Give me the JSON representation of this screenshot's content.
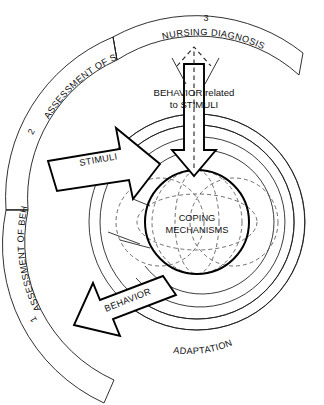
{
  "diagram": {
    "bands": [
      {
        "id": "nursing-diagnosis",
        "label": "NURSING DIAGNOSIS",
        "number": "3"
      },
      {
        "id": "assessment-of-stimuli",
        "label": "ASSESSMENT OF STIMULI",
        "number": "2"
      },
      {
        "id": "assessment-of-behavior",
        "label": "ASSESSMENT OF BEHAVIOR",
        "number": "1"
      }
    ],
    "center": {
      "line1": "COPING",
      "line2": "MECHANISMS"
    },
    "arrows": {
      "stimuli": "STIMULI",
      "behavior": "BEHAVIOR",
      "inward_callout_line1": "BEHAVIOR related",
      "inward_callout_line2": "to STIMULI"
    },
    "rings": {
      "adaptation": "ADAPTATION"
    },
    "colors": {
      "background": "#ffffff",
      "stroke": "#1a1a1a",
      "bold_stroke": "#000000",
      "dashed_stroke": "#555555"
    }
  }
}
